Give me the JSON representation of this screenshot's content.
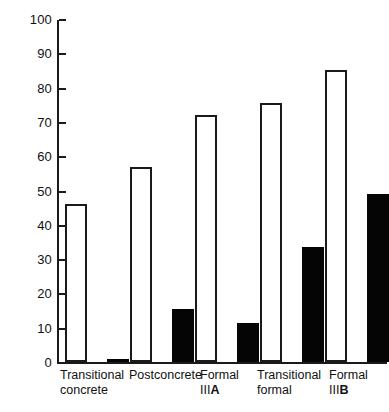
{
  "chart_data": {
    "type": "bar",
    "title": "",
    "subtitle": "",
    "xlabel": "",
    "ylabel": "",
    "ylim": [
      0,
      100
    ],
    "yticks": [
      0,
      10,
      20,
      30,
      40,
      50,
      60,
      70,
      80,
      90,
      100
    ],
    "ytick_labels": [
      "0",
      "10",
      "20",
      "30",
      "40",
      "50",
      "60",
      "70",
      "80",
      "90",
      "100"
    ],
    "grid": false,
    "legend": false,
    "legend_position": "none",
    "categories": [
      "Transitional concrete",
      "Postconcrete",
      "Formal IIIA",
      "Transitional formal",
      "Formal IIIB"
    ],
    "series": [
      {
        "name": "open",
        "color": "#ffffff",
        "edge_color": "#1a1a1a",
        "values": [
          46,
          57,
          72,
          75.5,
          85
        ]
      },
      {
        "name": "filled",
        "color": "#050505",
        "edge_color": "#050505",
        "values": [
          1,
          15.5,
          11.5,
          33.5,
          49
        ]
      }
    ]
  },
  "axis": {
    "ticks": [
      {
        "label": "100",
        "value": 100
      },
      {
        "label": "90",
        "value": 90
      },
      {
        "label": "80",
        "value": 80
      },
      {
        "label": "70",
        "value": 70
      },
      {
        "label": "60",
        "value": 60
      },
      {
        "label": "50",
        "value": 50
      },
      {
        "label": "40",
        "value": 40
      },
      {
        "label": "30",
        "value": 30
      },
      {
        "label": "20",
        "value": 20
      },
      {
        "label": "10",
        "value": 10
      },
      {
        "label": "0",
        "value": 0
      }
    ]
  },
  "categories": [
    {
      "line1": "Transitional",
      "line2": "concrete",
      "bold_suffix": ""
    },
    {
      "line1": "Postconcrete",
      "line2": "",
      "bold_suffix": ""
    },
    {
      "line1": "Formal",
      "line2": "III",
      "bold_suffix": "A"
    },
    {
      "line1": "Transitional",
      "line2": "formal",
      "bold_suffix": ""
    },
    {
      "line1": "Formal",
      "line2": "III",
      "bold_suffix": "B"
    }
  ]
}
